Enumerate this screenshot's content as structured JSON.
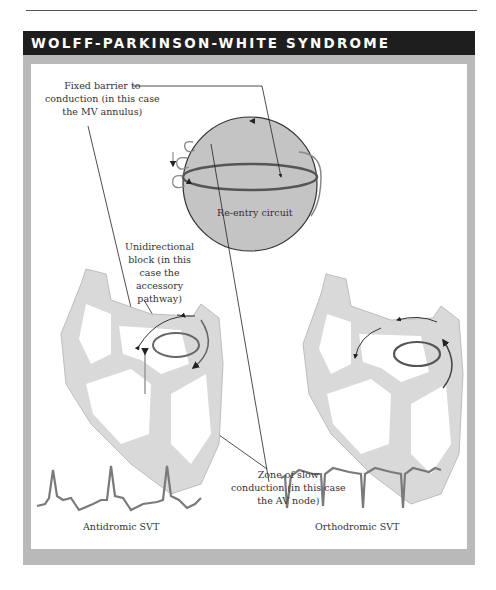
{
  "header": {
    "title": "WOLFF-PARKINSON-WHITE SYNDROME"
  },
  "labels": {
    "fixed_barrier": [
      "Fixed barrier to",
      "conduction (in this case",
      "the MV annulus)"
    ],
    "unidirectional_block": [
      "Unidirectional",
      "block (in this",
      "case the",
      "accessory",
      "pathway)"
    ],
    "reentry_circuit": "Re-entry circuit",
    "slow_zone": [
      "Zone of slow",
      "conduction (in this case",
      "the AV node)"
    ]
  },
  "ecg": {
    "antidromic": {
      "caption": "Antidromic SVT",
      "description": "wide upright complexes"
    },
    "orthodromic": {
      "caption": "Orthodromic SVT",
      "description": "narrow downward complexes"
    }
  },
  "colors": {
    "title_bar": "#1e1e1e",
    "frame": "#b9b9b9",
    "sphere": "#c4c4c4",
    "heart": "#d9d9d9",
    "circuit": "#777777",
    "ecg_trace": "#7a7a7a"
  }
}
